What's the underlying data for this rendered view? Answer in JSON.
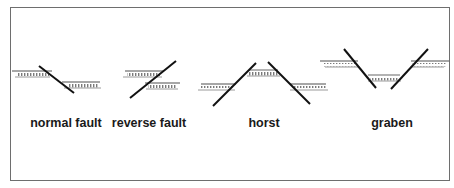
{
  "diagram": {
    "title": "",
    "frame": {
      "border_color": "#6e6e6e",
      "background": "#ffffff"
    },
    "colors": {
      "fault_line": "#111111",
      "stratum_line": "#8a8a8a",
      "label": "#1a1a1a"
    },
    "panels": [
      {
        "id": "normal-fault",
        "label": "normal fault",
        "label_x": 66
      },
      {
        "id": "reverse-fault",
        "label": "reverse fault",
        "label_x": 149
      },
      {
        "id": "horst",
        "label": "horst",
        "label_x": 264
      },
      {
        "id": "graben",
        "label": "graben",
        "label_x": 392
      }
    ]
  }
}
